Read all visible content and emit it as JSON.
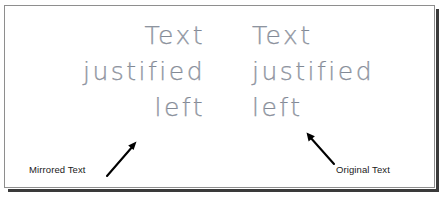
{
  "figure": {
    "caption_blocks": [
      {
        "id": "mirrored",
        "alignment": "right",
        "lines": [
          "Text",
          "justified",
          "left"
        ],
        "label": "Mirrored Text"
      },
      {
        "id": "original",
        "alignment": "left",
        "lines": [
          "Text",
          "justified",
          "left"
        ],
        "label": "Original Text"
      }
    ],
    "text_lines": {
      "line1": "Text",
      "line2": "justified",
      "line3": "left"
    },
    "labels": {
      "mirrored": "Mirrored Text",
      "original": "Original Text"
    },
    "colors": {
      "cad_text": "#9aa0ab",
      "label_text": "#1a1a1a",
      "arrow": "#000000",
      "panel_border": "#8e8e8e",
      "panel_shadow": "#3a3a3a",
      "background": "#ffffff"
    },
    "annotations": {
      "arrow_mirrored_direction": "up-right",
      "arrow_original_direction": "up-left"
    }
  }
}
